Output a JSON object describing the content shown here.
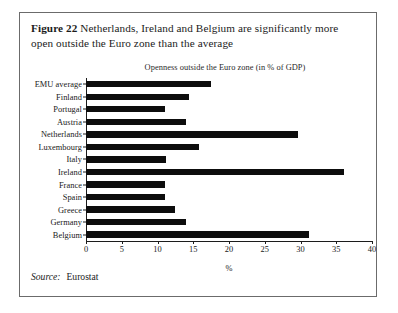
{
  "figure": {
    "label": "Figure 22",
    "caption": "Netherlands, Ireland and Belgium are significantly more open outside the Euro zone than the average",
    "source_word": "Source:",
    "source_value": "Eurostat"
  },
  "chart_data": {
    "type": "bar",
    "orientation": "horizontal",
    "title": "Openness outside the Euro zone (in % of GDP)",
    "xlabel": "%",
    "ylabel": "",
    "xlim": [
      0,
      40
    ],
    "xticks": [
      0,
      5,
      10,
      15,
      20,
      25,
      30,
      35,
      40
    ],
    "xticklabels": [
      "0",
      "5",
      "10",
      "15",
      "20",
      "25",
      "30",
      "35",
      "40"
    ],
    "grid": false,
    "legend": false,
    "bar_color": "#0d0d0d",
    "categories": [
      "EMU average",
      "Finland",
      "Portugal",
      "Austria",
      "Netherlands",
      "Luxembourg",
      "Italy",
      "Ireland",
      "France",
      "Spain",
      "Greece",
      "Germany",
      "Belgium"
    ],
    "values": [
      17.5,
      14.4,
      11.0,
      14.0,
      29.7,
      15.8,
      11.2,
      36.1,
      11.0,
      11.0,
      12.5,
      14.0,
      31.2
    ]
  }
}
